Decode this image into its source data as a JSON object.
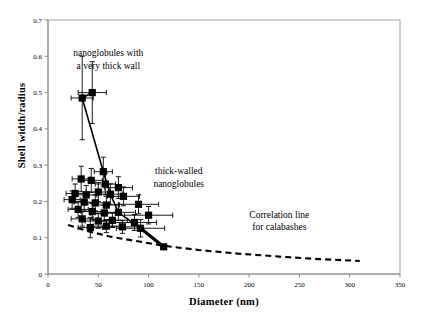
{
  "chart_data": {
    "type": "scatter",
    "title": "",
    "xlabel": "Diameter (nm)",
    "ylabel": "Shell width/radius",
    "xlim": [
      0,
      350
    ],
    "ylim": [
      0,
      0.7
    ],
    "xticks": [
      0,
      50,
      100,
      150,
      200,
      250,
      300,
      350
    ],
    "yticks": [
      0,
      0.1,
      0.2,
      0.3,
      0.4,
      0.5,
      0.6,
      0.7
    ],
    "xtick_labels": [
      "0",
      "50",
      "100",
      "150",
      "200",
      "250",
      "300",
      "350"
    ],
    "ytick_labels": [
      "0",
      "0.1",
      "0.2",
      "0.3",
      "0.4",
      "0.5",
      "0.6",
      "0.7"
    ],
    "grid": false,
    "legend": false,
    "marker": "filled-square",
    "marker_color": "#000000",
    "error_bars": "both",
    "series": [
      {
        "name": "nanoglobules",
        "points": [
          {
            "x": 34,
            "y": 0.485,
            "xerr": 11,
            "yerr": 0.115
          },
          {
            "x": 44,
            "y": 0.5,
            "xerr": 14,
            "yerr": 0.085
          },
          {
            "x": 55,
            "y": 0.282,
            "xerr": 9,
            "yerr": 0.04
          },
          {
            "x": 33,
            "y": 0.262,
            "xerr": 9,
            "yerr": 0.035
          },
          {
            "x": 43,
            "y": 0.258,
            "xerr": 11,
            "yerr": 0.033
          },
          {
            "x": 57,
            "y": 0.248,
            "xerr": 10,
            "yerr": 0.03
          },
          {
            "x": 70,
            "y": 0.238,
            "xerr": 14,
            "yerr": 0.03
          },
          {
            "x": 27,
            "y": 0.222,
            "xerr": 9,
            "yerr": 0.026
          },
          {
            "x": 38,
            "y": 0.218,
            "xerr": 10,
            "yerr": 0.026
          },
          {
            "x": 50,
            "y": 0.226,
            "xerr": 12,
            "yerr": 0.026
          },
          {
            "x": 62,
            "y": 0.22,
            "xerr": 12,
            "yerr": 0.028
          },
          {
            "x": 75,
            "y": 0.214,
            "xerr": 16,
            "yerr": 0.026
          },
          {
            "x": 24,
            "y": 0.205,
            "xerr": 8,
            "yerr": 0.024
          },
          {
            "x": 36,
            "y": 0.198,
            "xerr": 10,
            "yerr": 0.024
          },
          {
            "x": 47,
            "y": 0.196,
            "xerr": 11,
            "yerr": 0.022
          },
          {
            "x": 58,
            "y": 0.19,
            "xerr": 13,
            "yerr": 0.024
          },
          {
            "x": 90,
            "y": 0.192,
            "xerr": 20,
            "yerr": 0.026
          },
          {
            "x": 30,
            "y": 0.178,
            "xerr": 10,
            "yerr": 0.022
          },
          {
            "x": 44,
            "y": 0.172,
            "xerr": 11,
            "yerr": 0.022
          },
          {
            "x": 56,
            "y": 0.168,
            "xerr": 14,
            "yerr": 0.022
          },
          {
            "x": 70,
            "y": 0.17,
            "xerr": 17,
            "yerr": 0.022
          },
          {
            "x": 100,
            "y": 0.162,
            "xerr": 24,
            "yerr": 0.024
          },
          {
            "x": 34,
            "y": 0.152,
            "xerr": 11,
            "yerr": 0.02
          },
          {
            "x": 50,
            "y": 0.146,
            "xerr": 13,
            "yerr": 0.02
          },
          {
            "x": 64,
            "y": 0.148,
            "xerr": 15,
            "yerr": 0.02
          },
          {
            "x": 86,
            "y": 0.142,
            "xerr": 22,
            "yerr": 0.022
          },
          {
            "x": 42,
            "y": 0.128,
            "xerr": 12,
            "yerr": 0.028
          },
          {
            "x": 58,
            "y": 0.132,
            "xerr": 13,
            "yerr": 0.018
          },
          {
            "x": 74,
            "y": 0.13,
            "xerr": 18,
            "yerr": 0.018
          },
          {
            "x": 92,
            "y": 0.126,
            "xerr": 24,
            "yerr": 0.024
          },
          {
            "x": 115,
            "y": 0.075,
            "xerr": 0,
            "yerr": 0
          }
        ]
      }
    ],
    "connector_line": {
      "name": "nanoglobule trend",
      "style": "solid",
      "color": "#000000",
      "points": [
        {
          "x": 44,
          "y": 0.5
        },
        {
          "x": 34,
          "y": 0.485
        },
        {
          "x": 55,
          "y": 0.282
        },
        {
          "x": 62,
          "y": 0.22
        },
        {
          "x": 70,
          "y": 0.17
        },
        {
          "x": 92,
          "y": 0.126
        },
        {
          "x": 115,
          "y": 0.075
        }
      ]
    },
    "correlation_line": {
      "name": "Correlation line for calabashes",
      "style": "dashed",
      "color": "#000000",
      "points": [
        {
          "x": 20,
          "y": 0.135
        },
        {
          "x": 40,
          "y": 0.118
        },
        {
          "x": 60,
          "y": 0.104
        },
        {
          "x": 85,
          "y": 0.092
        },
        {
          "x": 115,
          "y": 0.078
        },
        {
          "x": 150,
          "y": 0.066
        },
        {
          "x": 190,
          "y": 0.056
        },
        {
          "x": 230,
          "y": 0.048
        },
        {
          "x": 270,
          "y": 0.041
        },
        {
          "x": 310,
          "y": 0.036
        }
      ]
    },
    "annotations": [
      {
        "id": "nanoglobules-thick-wall",
        "lines": [
          "nanoglobules with",
          "a very thick wall"
        ],
        "x": 60,
        "y": 0.6
      },
      {
        "id": "thick-walled-nanoglobules",
        "lines": [
          "thick-walled",
          "nanoglobules"
        ],
        "x": 130,
        "y": 0.275
      },
      {
        "id": "correlation-line-calabashes",
        "lines": [
          "Correlation line",
          "for calabashes"
        ],
        "x": 230,
        "y": 0.155
      }
    ]
  },
  "axes": {
    "x_title": "Diameter (nm)",
    "y_title": "Shell width/radius"
  }
}
